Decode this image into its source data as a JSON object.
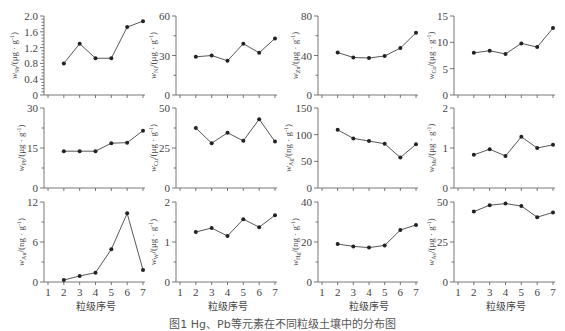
{
  "caption": "图1  Hg、Pb等元素在不同粒级土壤中的分布图",
  "xlabel": "粒级序号",
  "x_ticks": [
    "1",
    "2",
    "3",
    "4",
    "5",
    "6",
    "7"
  ],
  "chart_data": [
    {
      "type": "line",
      "element": "Sb",
      "ylabel": "w_Sb/(μg·g⁻¹)",
      "unit": "(μg · g",
      "x": [
        2,
        3,
        4,
        5,
        6,
        7
      ],
      "values": [
        0.8,
        1.3,
        0.93,
        0.93,
        1.72,
        1.87
      ],
      "ylim": [
        0,
        2.0
      ],
      "yticks": [
        "0",
        "0.4",
        "0.8",
        "1.2",
        "1.6",
        "2.0"
      ],
      "minor": 5
    },
    {
      "type": "line",
      "element": "Ni",
      "ylabel": "w_Ni/(μg·g⁻¹)",
      "unit": "(μg · g",
      "x": [
        2,
        3,
        4,
        5,
        6,
        7
      ],
      "values": [
        29,
        30,
        26,
        39,
        32,
        43
      ],
      "ylim": [
        0,
        60
      ],
      "yticks": [
        "0",
        "30",
        "60"
      ],
      "minor": 2
    },
    {
      "type": "line",
      "element": "Zn",
      "ylabel": "w_Zn/(μg·g⁻¹)",
      "unit": "(μg · g",
      "x": [
        2,
        3,
        4,
        5,
        6,
        7
      ],
      "values": [
        43,
        38,
        37.5,
        39.5,
        47.5,
        63
      ],
      "ylim": [
        0,
        80
      ],
      "yticks": [
        "0",
        "40",
        "80"
      ],
      "minor": 2
    },
    {
      "type": "line",
      "element": "Co",
      "ylabel": "w_Co/(μg·g⁻¹)",
      "unit": "(μg · g",
      "x": [
        2,
        3,
        4,
        5,
        6,
        7
      ],
      "values": [
        8.0,
        8.4,
        7.8,
        9.8,
        9.1,
        12.7
      ],
      "ylim": [
        0,
        15
      ],
      "yticks": [
        "0",
        "5",
        "10",
        "15"
      ],
      "minor": 1
    },
    {
      "type": "line",
      "element": "Pb",
      "ylabel": "w_Pb/(μg·g⁻¹)",
      "unit": "(μg · g",
      "x": [
        2,
        3,
        4,
        5,
        6,
        7
      ],
      "values": [
        13.8,
        13.8,
        13.8,
        16.8,
        17,
        21.5
      ],
      "ylim": [
        0,
        30
      ],
      "yticks": [
        "0",
        "15",
        "30"
      ],
      "minor": 2
    },
    {
      "type": "line",
      "element": "Cu",
      "ylabel": "w_Cu/(μg·g⁻¹)",
      "unit": "(μg · g",
      "x": [
        2,
        3,
        4,
        5,
        6,
        7
      ],
      "values": [
        37.5,
        28,
        34.5,
        29.5,
        43,
        29
      ],
      "ylim": [
        0,
        50
      ],
      "yticks": [
        "0",
        "25",
        "50"
      ],
      "minor": 2
    },
    {
      "type": "line",
      "element": "Ag",
      "ylabel": "w_Ag/(ng·g⁻¹)",
      "unit": "(ng · g",
      "x": [
        2,
        3,
        4,
        5,
        6,
        7
      ],
      "values": [
        109,
        93,
        88,
        83,
        57,
        82
      ],
      "ylim": [
        0,
        150
      ],
      "yticks": [
        "0",
        "50",
        "100",
        "150"
      ],
      "minor": 1
    },
    {
      "type": "line",
      "element": "Mo",
      "ylabel": "w_Mo/(μg·g⁻¹)",
      "unit": "(μg · g",
      "x": [
        2,
        3,
        4,
        5,
        6,
        7
      ],
      "values": [
        0.83,
        0.97,
        0.8,
        1.28,
        1.0,
        1.08
      ],
      "ylim": [
        0,
        2
      ],
      "yticks": [
        "0",
        "1",
        "2"
      ],
      "minor": 2
    },
    {
      "type": "line",
      "element": "Au",
      "ylabel": "w_Au/(ng·g⁻¹)",
      "unit": "(ng · g",
      "x": [
        2,
        3,
        4,
        5,
        6,
        7
      ],
      "values": [
        0.3,
        0.9,
        1.4,
        4.9,
        10.3,
        1.8
      ],
      "ylim": [
        0,
        12
      ],
      "yticks": [
        "0",
        "6",
        "12"
      ],
      "minor": 2
    },
    {
      "type": "line",
      "element": "W",
      "ylabel": "w_W/(μg·g⁻¹)",
      "unit": "(μg · g",
      "x": [
        2,
        3,
        4,
        5,
        6,
        7
      ],
      "values": [
        1.25,
        1.35,
        1.15,
        1.57,
        1.37,
        1.67
      ],
      "ylim": [
        0,
        2
      ],
      "yticks": [
        "0",
        "1",
        "2"
      ],
      "minor": 2
    },
    {
      "type": "line",
      "element": "Hg",
      "ylabel": "w_Hg/(ng·g⁻¹)",
      "unit": "(ng · g",
      "x": [
        2,
        3,
        4,
        5,
        6,
        7
      ],
      "values": [
        19,
        17.8,
        17.2,
        18.3,
        26,
        28.5
      ],
      "ylim": [
        0,
        40
      ],
      "yticks": [
        "0",
        "20",
        "40"
      ],
      "minor": 2
    },
    {
      "type": "line",
      "element": "As",
      "ylabel": "w_As/(μg·g⁻¹)",
      "unit": "(μg · g",
      "x": [
        2,
        3,
        4,
        5,
        6,
        7
      ],
      "values": [
        44,
        48,
        49,
        47.5,
        40.5,
        43.5
      ],
      "ylim": [
        0,
        50
      ],
      "yticks": [
        "0",
        "25",
        "50"
      ],
      "minor": 2
    }
  ]
}
